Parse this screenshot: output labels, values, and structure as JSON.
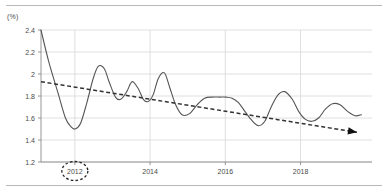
{
  "unit_label": "(%)",
  "colors": {
    "rule": "#b9b9b9",
    "grid": "#d8d8d8",
    "axis": "#8a8a8a",
    "series_line": "#555555",
    "trend_line": "#333333",
    "highlight_ring": "#222222",
    "tick_text": "#4a4a4a"
  },
  "chart_data": {
    "type": "line",
    "title": "",
    "xlabel": "",
    "ylabel": "(%)",
    "ylim": [
      1.2,
      2.4
    ],
    "xlim": [
      2011.1,
      2019.9
    ],
    "grid": true,
    "legend": false,
    "y_ticks": [
      "2.4",
      "2.2",
      "2",
      "1.8",
      "1.6",
      "1.4",
      "1.2"
    ],
    "y_tick_values": [
      2.4,
      2.2,
      2.0,
      1.8,
      1.6,
      1.4,
      1.2
    ],
    "x_ticks": [
      "2012",
      "2014",
      "2016",
      "2018"
    ],
    "x_tick_values": [
      2012,
      2014,
      2016,
      2018
    ],
    "annotations": [
      {
        "name": "highlight-2012",
        "type": "dashed-ellipse",
        "target_label": "2012",
        "x": 2012
      },
      {
        "name": "trend-arrow",
        "type": "arrowhead",
        "x": 2019.5,
        "y": 1.47
      }
    ],
    "series": [
      {
        "name": "rate",
        "style": "solid",
        "x": [
          2011.1,
          2011.3,
          2011.55,
          2011.75,
          2011.9,
          2012.0,
          2012.15,
          2012.32,
          2012.48,
          2012.62,
          2012.78,
          2012.92,
          2013.08,
          2013.22,
          2013.38,
          2013.52,
          2013.68,
          2013.82,
          2013.95,
          2014.08,
          2014.22,
          2014.38,
          2014.52,
          2014.68,
          2014.85,
          2015.05,
          2015.25,
          2015.45,
          2015.65,
          2015.85,
          2016.02,
          2016.18,
          2016.35,
          2016.52,
          2016.7,
          2016.88,
          2017.05,
          2017.22,
          2017.4,
          2017.58,
          2017.78,
          2017.95,
          2018.12,
          2018.3,
          2018.48,
          2018.66,
          2018.85,
          2019.05,
          2019.25,
          2019.45,
          2019.62
        ],
        "y": [
          2.4,
          2.12,
          1.83,
          1.6,
          1.52,
          1.5,
          1.55,
          1.74,
          1.95,
          2.07,
          2.05,
          1.92,
          1.79,
          1.77,
          1.84,
          1.93,
          1.87,
          1.77,
          1.75,
          1.81,
          1.96,
          2.01,
          1.88,
          1.72,
          1.63,
          1.64,
          1.72,
          1.78,
          1.79,
          1.79,
          1.79,
          1.78,
          1.74,
          1.66,
          1.58,
          1.53,
          1.57,
          1.7,
          1.81,
          1.84,
          1.77,
          1.66,
          1.59,
          1.57,
          1.6,
          1.68,
          1.73,
          1.72,
          1.66,
          1.62,
          1.63
        ]
      },
      {
        "name": "trend",
        "style": "dashed",
        "x": [
          2011.1,
          2019.5
        ],
        "y": [
          1.93,
          1.47
        ]
      }
    ]
  }
}
